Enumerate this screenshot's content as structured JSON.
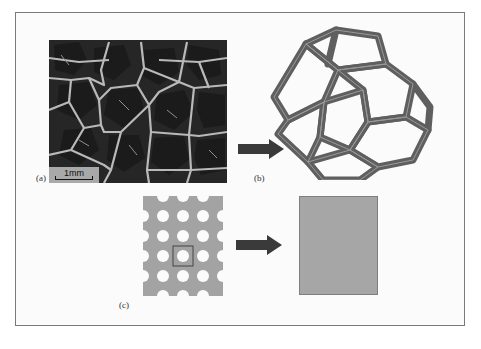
{
  "figure": {
    "panels": [
      {
        "id": "a",
        "label": "(a)",
        "description": "SEM micrograph of open-cell foam",
        "scale_bar": "1mm"
      },
      {
        "id": "b",
        "label": "(b)",
        "description": "Tetrakaidecahedron (Kelvin cell) strut model"
      },
      {
        "id": "c",
        "label": "(c)",
        "description": "Perforated plate with highlighted unit cell, homogenized to solid block"
      }
    ],
    "arrows": [
      {
        "from": "a",
        "to": "b",
        "direction": "right"
      },
      {
        "from": "c-plate",
        "to": "c-block",
        "direction": "right"
      }
    ],
    "plate": {
      "rows": 5,
      "cols": 5,
      "highlighted_cell": [
        2,
        2
      ]
    },
    "colors": {
      "frame_border": "#7a7a7a",
      "sem_background": "#2a2a2a",
      "strut": "#6e6e6e",
      "plate": "#a3a3a3",
      "block": "#a6a6a6",
      "arrow": "#3a3a3a",
      "hole": "#f0f0f0"
    }
  }
}
